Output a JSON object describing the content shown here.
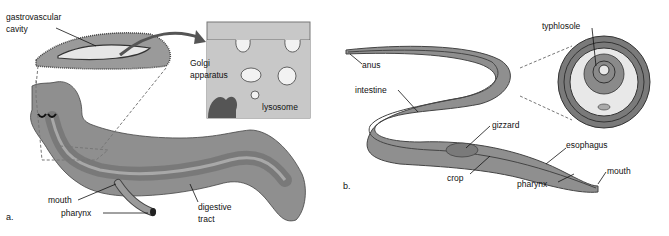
{
  "panel_a": {
    "panel_label": "a.",
    "subject": "planarian",
    "labels": {
      "gastrovascular_line1": "gastrovascular",
      "gastrovascular_line2": "cavity",
      "golgi_line1": "Golgi",
      "golgi_line2": "apparatus",
      "lysosome": "lysosome",
      "mouth": "mouth",
      "pharynx": "pharynx",
      "digestive_line1": "digestive",
      "digestive_line2": "tract"
    }
  },
  "panel_b": {
    "panel_label": "b.",
    "subject": "earthworm",
    "labels": {
      "typhlosole": "typhlosole",
      "anus": "anus",
      "intestine": "intestine",
      "gizzard": "gizzard",
      "esophagus": "esophagus",
      "crop": "crop",
      "pharynx": "pharynx",
      "mouth": "mouth"
    }
  },
  "colors": {
    "body": "#8f8f8f",
    "body_dark": "#6e6e6e",
    "tract": "#777777",
    "inset_bg": "#c8c8c8",
    "light": "#e8e8e8"
  }
}
